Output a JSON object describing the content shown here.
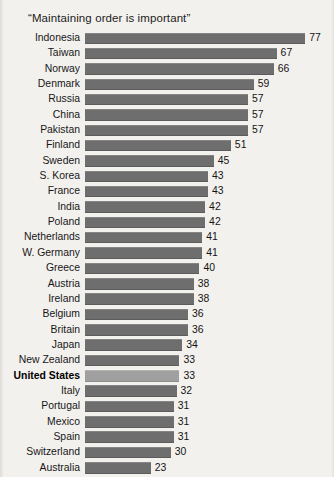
{
  "chart_data": {
    "type": "bar",
    "orientation": "horizontal",
    "title": "“Maintaining order is important”",
    "xlabel": "",
    "ylabel": "",
    "xlim": [
      0,
      77
    ],
    "grid": false,
    "legend": null,
    "highlight_category": "United States",
    "colors": {
      "bar": "#6e6e6e",
      "bar_highlight": "#a0a0a0",
      "background": "#f3f1ee",
      "text": "#171717"
    },
    "categories": [
      "Indonesia",
      "Taiwan",
      "Norway",
      "Denmark",
      "Russia",
      "China",
      "Pakistan",
      "Finland",
      "Sweden",
      "S. Korea",
      "France",
      "India",
      "Poland",
      "Netherlands",
      "W. Germany",
      "Greece",
      "Austria",
      "Ireland",
      "Belgium",
      "Britain",
      "Japan",
      "New Zealand",
      "United States",
      "Italy",
      "Portugal",
      "Mexico",
      "Spain",
      "Switzerland",
      "Australia",
      "Canada"
    ],
    "values": [
      77,
      67,
      66,
      59,
      57,
      57,
      57,
      51,
      45,
      43,
      43,
      42,
      42,
      41,
      41,
      40,
      38,
      38,
      36,
      36,
      34,
      33,
      33,
      32,
      31,
      31,
      31,
      30,
      23,
      21
    ],
    "rows": [
      {
        "label": "Indonesia",
        "value": 77,
        "value_text": "77",
        "highlight": false
      },
      {
        "label": "Taiwan",
        "value": 67,
        "value_text": "67",
        "highlight": false
      },
      {
        "label": "Norway",
        "value": 66,
        "value_text": "66",
        "highlight": false
      },
      {
        "label": "Denmark",
        "value": 59,
        "value_text": "59",
        "highlight": false
      },
      {
        "label": "Russia",
        "value": 57,
        "value_text": "57",
        "highlight": false
      },
      {
        "label": "China",
        "value": 57,
        "value_text": "57",
        "highlight": false
      },
      {
        "label": "Pakistan",
        "value": 57,
        "value_text": "57",
        "highlight": false
      },
      {
        "label": "Finland",
        "value": 51,
        "value_text": "51",
        "highlight": false
      },
      {
        "label": "Sweden",
        "value": 45,
        "value_text": "45",
        "highlight": false
      },
      {
        "label": "S. Korea",
        "value": 43,
        "value_text": "43",
        "highlight": false
      },
      {
        "label": "France",
        "value": 43,
        "value_text": "43",
        "highlight": false
      },
      {
        "label": "India",
        "value": 42,
        "value_text": "42",
        "highlight": false
      },
      {
        "label": "Poland",
        "value": 42,
        "value_text": "42",
        "highlight": false
      },
      {
        "label": "Netherlands",
        "value": 41,
        "value_text": "41",
        "highlight": false
      },
      {
        "label": "W. Germany",
        "value": 41,
        "value_text": "41",
        "highlight": false
      },
      {
        "label": "Greece",
        "value": 40,
        "value_text": "40",
        "highlight": false
      },
      {
        "label": "Austria",
        "value": 38,
        "value_text": "38",
        "highlight": false
      },
      {
        "label": "Ireland",
        "value": 38,
        "value_text": "38",
        "highlight": false
      },
      {
        "label": "Belgium",
        "value": 36,
        "value_text": "36",
        "highlight": false
      },
      {
        "label": "Britain",
        "value": 36,
        "value_text": "36",
        "highlight": false
      },
      {
        "label": "Japan",
        "value": 34,
        "value_text": "34",
        "highlight": false
      },
      {
        "label": "New Zealand",
        "value": 33,
        "value_text": "33",
        "highlight": false
      },
      {
        "label": "United States",
        "value": 33,
        "value_text": "33",
        "highlight": true
      },
      {
        "label": "Italy",
        "value": 32,
        "value_text": "32",
        "highlight": false
      },
      {
        "label": "Portugal",
        "value": 31,
        "value_text": "31",
        "highlight": false
      },
      {
        "label": "Mexico",
        "value": 31,
        "value_text": "31",
        "highlight": false
      },
      {
        "label": "Spain",
        "value": 31,
        "value_text": "31",
        "highlight": false
      },
      {
        "label": "Switzerland",
        "value": 30,
        "value_text": "30",
        "highlight": false
      },
      {
        "label": "Australia",
        "value": 23,
        "value_text": "23",
        "highlight": false
      },
      {
        "label": "Canada",
        "value": 21,
        "value_text": "21",
        "highlight": false
      }
    ]
  },
  "layout": {
    "bar_origin_x": 85,
    "px_per_unit": 2.86,
    "value_gap": 4
  }
}
